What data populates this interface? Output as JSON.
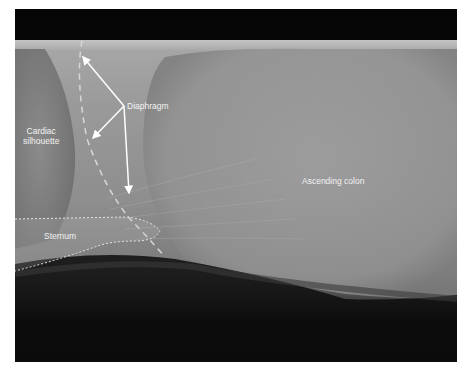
{
  "figure": {
    "type": "lateral abdominal radiograph with annotations",
    "labels": {
      "diaphragm": "Diaphragm",
      "cardiac_line1": "Cardiac",
      "cardiac_line2": "silhouette",
      "sternum": "Sternum",
      "ascending_colon": "Ascending colon"
    },
    "colors": {
      "annotation": "#ffffff",
      "background_film": "#9a9a9a",
      "border_black": "#000000"
    }
  }
}
